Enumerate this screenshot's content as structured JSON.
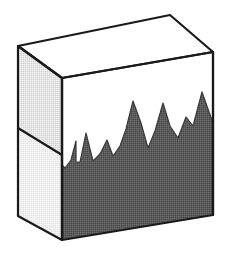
{
  "figure": {
    "title": "Isometric box with jagged fill level",
    "caption": "",
    "width": 229,
    "height": 257,
    "background_color": "#ffffff"
  },
  "palette": {
    "outline": "#1a1a1a",
    "top_face": "#ffffff",
    "left_face_upper": "#dedede",
    "left_face_lower": "#ededed",
    "front_face_empty": "#ffffff",
    "fill_dark": "#555555",
    "fill_dark_dither": "#6b6b6b"
  },
  "geometry": {
    "outline_width": 2.2,
    "top_face": {
      "name": "top-face",
      "points": "18,46 170,15 213,52 62,78"
    },
    "left_face_upper": {
      "name": "left-face-upper",
      "points": "18,46 62,78 62,155 18,128"
    },
    "left_face_lower": {
      "name": "left-face-lower",
      "points": "18,128 62,155 62,240 18,216"
    },
    "front_face": {
      "name": "front-face",
      "points": "62,78 213,52 213,215 62,240"
    },
    "left_divider_line": {
      "name": "left-face-divider",
      "x1": 18,
      "y1": 128,
      "x2": 62,
      "y2": 155
    },
    "front_vertical_edge": {
      "name": "front-left-vertical-edge",
      "x1": 62,
      "y1": 78,
      "x2": 62,
      "y2": 240
    },
    "fill_region": {
      "name": "fill-region",
      "points": "62,240 213,215 213,215 213,123 202,92 193,126 186,117 178,138 170,126 163,103 155,131 148,148 141,123 133,101 126,129 120,146 113,156 107,140 100,154 93,161 86,133 80,162 76,162 76,141 71,160 65,168 62,165"
    }
  },
  "fill_profile": {
    "description": "Jagged mountain-like silhouette marking the fill level inside the front face",
    "points": [
      {
        "x": 62,
        "y": 165
      },
      {
        "x": 65,
        "y": 168
      },
      {
        "x": 71,
        "y": 160
      },
      {
        "x": 76,
        "y": 141
      },
      {
        "x": 76,
        "y": 162
      },
      {
        "x": 80,
        "y": 162
      },
      {
        "x": 86,
        "y": 133
      },
      {
        "x": 93,
        "y": 161
      },
      {
        "x": 100,
        "y": 154
      },
      {
        "x": 107,
        "y": 140
      },
      {
        "x": 113,
        "y": 156
      },
      {
        "x": 120,
        "y": 146
      },
      {
        "x": 126,
        "y": 129
      },
      {
        "x": 133,
        "y": 101
      },
      {
        "x": 141,
        "y": 123
      },
      {
        "x": 148,
        "y": 148
      },
      {
        "x": 155,
        "y": 131
      },
      {
        "x": 163,
        "y": 103
      },
      {
        "x": 170,
        "y": 126
      },
      {
        "x": 178,
        "y": 138
      },
      {
        "x": 186,
        "y": 117
      },
      {
        "x": 193,
        "y": 126
      },
      {
        "x": 202,
        "y": 92
      },
      {
        "x": 213,
        "y": 123
      }
    ]
  },
  "labels": {
    "none_visible": ""
  }
}
